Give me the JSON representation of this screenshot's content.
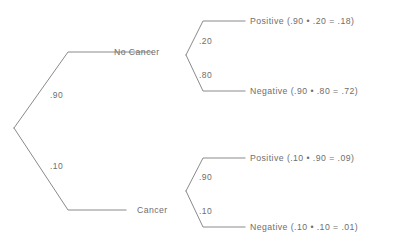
{
  "diagram": {
    "type": "probability-tree",
    "root": {
      "branches": [
        {
          "probability": ".90",
          "node_label": "No Cancer"
        },
        {
          "probability": ".10",
          "node_label": "Cancer"
        }
      ]
    },
    "nodes": [
      {
        "name": "no-cancer",
        "label": "No Cancer",
        "branch_probability": ".90",
        "outcomes": [
          {
            "name": "positive",
            "probability": ".20",
            "label": "Positive (.90 • .20 = .18)"
          },
          {
            "name": "negative",
            "probability": ".80",
            "label": "Negative (.90 • .80 = .72)"
          }
        ]
      },
      {
        "name": "cancer",
        "label": "Cancer",
        "branch_probability": ".10",
        "outcomes": [
          {
            "name": "positive",
            "probability": ".90",
            "label": "Positive (.10 • .90 = .09)"
          },
          {
            "name": "negative",
            "probability": ".10",
            "label": "Negative (.10 • .10 = .01)"
          }
        ]
      }
    ]
  },
  "colors": {
    "line": "#8a8a8a",
    "text": "#6e6e6e",
    "background": "#ffffff"
  }
}
